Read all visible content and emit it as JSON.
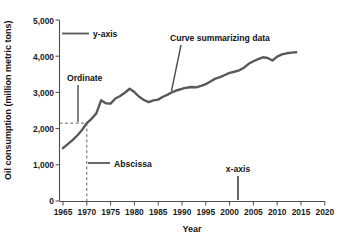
{
  "chart_data": {
    "type": "line",
    "title": "",
    "xlabel": "Year",
    "ylabel": "Oil consumption (million metric tons)",
    "xlim": [
      1965,
      2020
    ],
    "ylim": [
      0,
      5000
    ],
    "grid": false,
    "legend": "none",
    "x_ticks": [
      "1965",
      "1970",
      "1975",
      "1980",
      "1985",
      "1990",
      "1995",
      "2000",
      "2005",
      "2010",
      "2015",
      "2020"
    ],
    "y_ticks": [
      "0",
      "1,000",
      "2,000",
      "3,000",
      "4,000",
      "5,000"
    ],
    "series": [
      {
        "name": "World oil consumption",
        "x": [
          1965,
          1966,
          1967,
          1968,
          1969,
          1970,
          1971,
          1972,
          1973,
          1974,
          1975,
          1976,
          1977,
          1978,
          1979,
          1980,
          1981,
          1982,
          1983,
          1984,
          1985,
          1986,
          1987,
          1988,
          1989,
          1990,
          1991,
          1992,
          1993,
          1994,
          1995,
          1996,
          1997,
          1998,
          1999,
          2000,
          2001,
          2002,
          2003,
          2004,
          2005,
          2006,
          2007,
          2008,
          2009,
          2010,
          2011,
          2012,
          2013,
          2014
        ],
        "values": [
          1460,
          1570,
          1680,
          1810,
          1960,
          2150,
          2270,
          2420,
          2780,
          2700,
          2690,
          2830,
          2900,
          2990,
          3100,
          3010,
          2880,
          2790,
          2730,
          2780,
          2800,
          2880,
          2940,
          3010,
          3060,
          3100,
          3130,
          3150,
          3140,
          3180,
          3230,
          3300,
          3380,
          3420,
          3480,
          3540,
          3570,
          3610,
          3680,
          3790,
          3860,
          3920,
          3970,
          3950,
          3880,
          3990,
          4050,
          4080,
          4100,
          4110
        ]
      }
    ],
    "annotations": [
      {
        "id": "y-axis",
        "label": "y-axis"
      },
      {
        "id": "x-axis",
        "label": "x-axis"
      },
      {
        "id": "ordinate",
        "label": "Ordinate"
      },
      {
        "id": "abscissa",
        "label": "Abscissa"
      },
      {
        "id": "curve",
        "label": "Curve summarizing data"
      }
    ],
    "reference_point": {
      "x": 1970,
      "y": 2150
    },
    "colors": {
      "curve": "#595959",
      "axis": "#4d4d4d",
      "text": "#111111",
      "background": "#ffffff"
    }
  }
}
